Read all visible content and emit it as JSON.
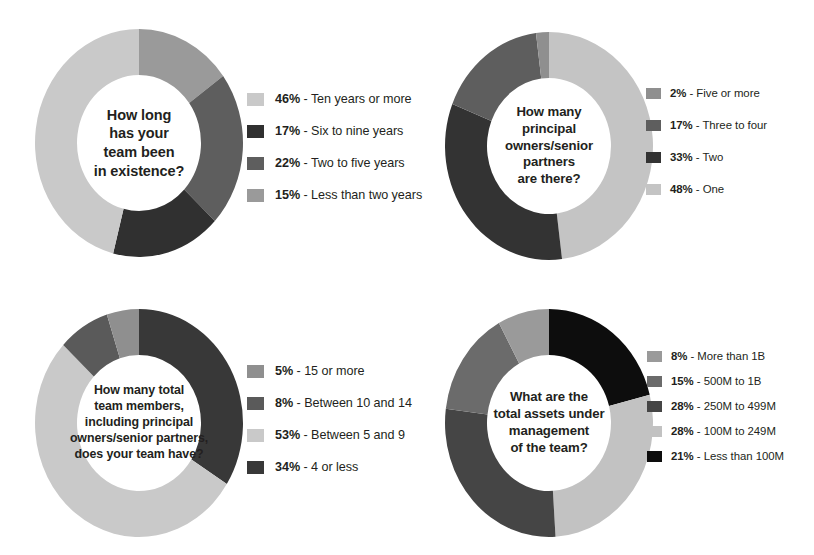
{
  "page": {
    "background": "#ffffff",
    "text_color": "#231f20"
  },
  "palette": {
    "light": "#c9c9c9",
    "light_alt": "#bdbdbd",
    "medium": "#9a9a9a",
    "medium_dark": "#6f6f6f",
    "dark": "#4a4a4a",
    "near_black": "#303030",
    "black": "#0d0d0d"
  },
  "charts": [
    {
      "id": "team-existence",
      "center_text": "How long\nhas your\nteam been\nin existence?",
      "legend": [
        {
          "pct": "46%",
          "sep": " - ",
          "label": "Ten years or more",
          "value": 46,
          "color": "#c9c9c9"
        },
        {
          "pct": "17%",
          "sep": " - ",
          "label": "Six to nine years",
          "value": 17,
          "color": "#303030"
        },
        {
          "pct": "22%",
          "sep": " - ",
          "label": "Two to five years",
          "value": 22,
          "color": "#5e5e5e"
        },
        {
          "pct": "15%",
          "sep": " - ",
          "label": "Less than two years",
          "value": 15,
          "color": "#9a9a9a"
        }
      ]
    },
    {
      "id": "principal-owners",
      "center_text": "How many\nprincipal\nowners/senior\npartners\nare there?",
      "legend": [
        {
          "pct": "2%",
          "sep": " - ",
          "label": "Five or more",
          "value": 2,
          "color": "#8f8f8f"
        },
        {
          "pct": "17%",
          "sep": " - ",
          "label": "Three to four",
          "value": 17,
          "color": "#5e5e5e"
        },
        {
          "pct": "33%",
          "sep": " - ",
          "label": "Two",
          "value": 33,
          "color": "#333333"
        },
        {
          "pct": "48%",
          "sep": " - ",
          "label": "One",
          "value": 48,
          "color": "#c4c4c4"
        }
      ]
    },
    {
      "id": "total-team-members",
      "center_text": "How many total\nteam members,\nincluding principal\nowners/senior partners,\ndoes your team have?",
      "legend": [
        {
          "pct": "5%",
          "sep": " - ",
          "label": "15 or more",
          "value": 5,
          "color": "#8f8f8f"
        },
        {
          "pct": "8%",
          "sep": " - ",
          "label": "Between 10 and 14",
          "value": 8,
          "color": "#5a5a5a"
        },
        {
          "pct": "53%",
          "sep": " - ",
          "label": "Between 5 and 9",
          "value": 53,
          "color": "#c9c9c9"
        },
        {
          "pct": "34%",
          "sep": " - ",
          "label": "4 or less",
          "value": 34,
          "color": "#383838"
        }
      ]
    },
    {
      "id": "assets-under-management",
      "center_text": "What are the\ntotal assets under\nmanagement\nof the team?",
      "legend": [
        {
          "pct": "8%",
          "sep": " - ",
          "label": "More than 1B",
          "value": 8,
          "color": "#9a9a9a"
        },
        {
          "pct": "15%",
          "sep": " - ",
          "label": "500M to 1B",
          "value": 15,
          "color": "#6b6b6b"
        },
        {
          "pct": "28%",
          "sep": " - ",
          "label": "250M to 499M",
          "value": 28,
          "color": "#454545"
        },
        {
          "pct": "28%",
          "sep": " - ",
          "label": "100M to 249M",
          "value": 28,
          "color": "#c2c2c2"
        },
        {
          "pct": "21%",
          "sep": " - ",
          "label": "Less than 100M",
          "value": 21,
          "color": "#0d0d0d"
        }
      ]
    }
  ],
  "chart_data": [
    {
      "type": "pie",
      "title": "How long has your team been in existence?",
      "variant": "donut",
      "units": "percent",
      "total": 100,
      "legend_position": "right",
      "start_angle_deg": 0,
      "direction": "clockwise",
      "categories": [
        "Less than two years",
        "Two to five years",
        "Six to nine years",
        "Ten years or more"
      ],
      "values": [
        15,
        22,
        17,
        46
      ],
      "slice_colors": [
        "#9a9a9a",
        "#5e5e5e",
        "#303030",
        "#c9c9c9"
      ],
      "draw_order_from_12oclock": [
        {
          "label": "Less than two years",
          "value": 15,
          "color": "#9a9a9a"
        },
        {
          "label": "Two to five years",
          "value": 22,
          "color": "#5e5e5e"
        },
        {
          "label": "Six to nine years",
          "value": 17,
          "color": "#303030"
        },
        {
          "label": "Ten years or more",
          "value": 46,
          "color": "#c9c9c9"
        }
      ]
    },
    {
      "type": "pie",
      "title": "How many principal owners/senior partners are there?",
      "variant": "donut",
      "units": "percent",
      "total": 100,
      "legend_position": "right",
      "start_angle_deg": 0,
      "direction": "clockwise",
      "categories": [
        "One",
        "Two",
        "Three to four",
        "Five or more"
      ],
      "values": [
        48,
        33,
        17,
        2
      ],
      "slice_colors": [
        "#c4c4c4",
        "#333333",
        "#5e5e5e",
        "#8f8f8f"
      ],
      "draw_order_from_12oclock": [
        {
          "label": "One",
          "value": 48,
          "color": "#c4c4c4"
        },
        {
          "label": "Two",
          "value": 33,
          "color": "#333333"
        },
        {
          "label": "Three to four",
          "value": 17,
          "color": "#5e5e5e"
        },
        {
          "label": "Five or more",
          "value": 2,
          "color": "#8f8f8f"
        }
      ]
    },
    {
      "type": "pie",
      "title": "How many total team members, including principal owners/senior partners, does your team have?",
      "variant": "donut",
      "units": "percent",
      "total": 100,
      "legend_position": "right",
      "start_angle_deg": 0,
      "direction": "clockwise",
      "categories": [
        "4 or less",
        "Between 5 and 9",
        "Between 10 and 14",
        "15 or more"
      ],
      "values": [
        34,
        53,
        8,
        5
      ],
      "slice_colors": [
        "#383838",
        "#c9c9c9",
        "#5a5a5a",
        "#8f8f8f"
      ],
      "draw_order_from_12oclock": [
        {
          "label": "4 or less",
          "value": 34,
          "color": "#383838"
        },
        {
          "label": "Between 5 and 9",
          "value": 53,
          "color": "#c9c9c9"
        },
        {
          "label": "Between 10 and 14",
          "value": 8,
          "color": "#5a5a5a"
        },
        {
          "label": "15 or more",
          "value": 5,
          "color": "#8f8f8f"
        }
      ]
    },
    {
      "type": "pie",
      "title": "What are the total assets under management of the team?",
      "variant": "donut",
      "units": "percent",
      "total": 100,
      "legend_position": "right",
      "start_angle_deg": 0,
      "direction": "clockwise",
      "categories": [
        "Less than 100M",
        "100M to 249M",
        "250M to 499M",
        "500M to 1B",
        "More than 1B"
      ],
      "values": [
        21,
        28,
        28,
        15,
        8
      ],
      "slice_colors": [
        "#0d0d0d",
        "#c2c2c2",
        "#454545",
        "#6b6b6b",
        "#9a9a9a"
      ],
      "draw_order_from_12oclock": [
        {
          "label": "Less than 100M",
          "value": 21,
          "color": "#0d0d0d"
        },
        {
          "label": "100M to 249M",
          "value": 28,
          "color": "#c2c2c2"
        },
        {
          "label": "250M to 499M",
          "value": 28,
          "color": "#454545"
        },
        {
          "label": "500M to 1B",
          "value": 15,
          "color": "#6b6b6b"
        },
        {
          "label": "More than 1B",
          "value": 8,
          "color": "#9a9a9a"
        }
      ]
    }
  ]
}
